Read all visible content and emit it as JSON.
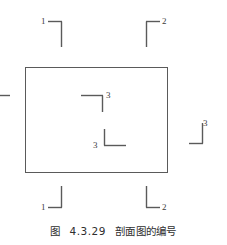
{
  "figure": {
    "caption_prefix": "图",
    "caption_number": "4.3.29",
    "caption_title": "剖面图的编号",
    "line_color": "#5a5a5a",
    "text_color": "#3b3b3b",
    "background_color": "#ffffff"
  },
  "outline": {
    "name": "plan-outline-rectangle",
    "x": 25,
    "y": 67,
    "width": 142,
    "height": 105
  },
  "section_marks": [
    {
      "id": "top-left-1",
      "label": "1",
      "label_x": 41,
      "label_y": 17,
      "lines": [
        {
          "x1": 48,
          "y1": 21.5,
          "x2": 62,
          "y2": 21.5
        },
        {
          "x1": 61.5,
          "y1": 21.5,
          "x2": 61.5,
          "y2": 47
        }
      ]
    },
    {
      "id": "top-right-2",
      "label": "2",
      "label_x": 162,
      "label_y": 17,
      "lines": [
        {
          "x1": 146,
          "y1": 21.5,
          "x2": 160,
          "y2": 21.5
        },
        {
          "x1": 146.5,
          "y1": 21.5,
          "x2": 146.5,
          "y2": 47
        }
      ]
    },
    {
      "id": "bottom-left-1",
      "label": "1",
      "label_x": 41,
      "label_y": 203,
      "lines": [
        {
          "x1": 48,
          "y1": 207.5,
          "x2": 62,
          "y2": 207.5
        },
        {
          "x1": 61.5,
          "y1": 186,
          "x2": 61.5,
          "y2": 207.5
        }
      ]
    },
    {
      "id": "bottom-right-2",
      "label": "2",
      "label_x": 162,
      "label_y": 203,
      "lines": [
        {
          "x1": 146,
          "y1": 207.5,
          "x2": 160,
          "y2": 207.5
        },
        {
          "x1": 146.5,
          "y1": 186,
          "x2": 146.5,
          "y2": 207.5
        }
      ]
    },
    {
      "id": "inner-upper-3",
      "label": "3",
      "label_x": 106,
      "label_y": 91,
      "lines": [
        {
          "x1": 81,
          "y1": 95.5,
          "x2": 103,
          "y2": 95.5
        },
        {
          "x1": 102.5,
          "y1": 95.5,
          "x2": 102.5,
          "y2": 112
        }
      ]
    },
    {
      "id": "inner-lower-3",
      "label": "3",
      "label_x": 93,
      "label_y": 141,
      "lines": [
        {
          "x1": 104,
          "y1": 145.5,
          "x2": 126,
          "y2": 145.5
        },
        {
          "x1": 104.5,
          "y1": 129,
          "x2": 104.5,
          "y2": 145.5
        }
      ]
    },
    {
      "id": "right-outer-3",
      "label": "3",
      "label_x": 203,
      "label_y": 119,
      "lines": [
        {
          "x1": 189,
          "y1": 143.5,
          "x2": 203,
          "y2": 143.5
        },
        {
          "x1": 202.5,
          "y1": 123,
          "x2": 202.5,
          "y2": 143.5
        }
      ]
    },
    {
      "id": "left-edge-clipped",
      "label": "",
      "lines": [
        {
          "x1": 0,
          "y1": 95.5,
          "x2": 10,
          "y2": 95.5
        }
      ]
    }
  ]
}
